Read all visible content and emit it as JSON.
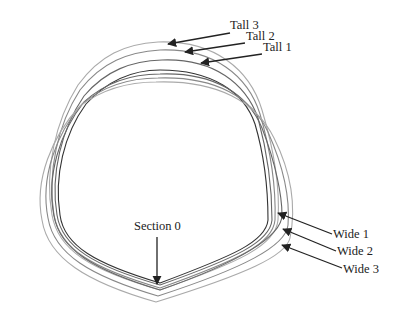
{
  "diagram": {
    "title": "",
    "labels": {
      "tall3": "Tall 3",
      "tall2": "Tall 2",
      "tall1": "Tall 1",
      "wide1": "Wide 1",
      "wide2": "Wide 2",
      "wide3": "Wide 3",
      "section0": "Section 0"
    },
    "curves": [
      {
        "id": "section0",
        "name": "Section 0",
        "color": "#333333"
      },
      {
        "id": "tall1",
        "name": "Tall 1",
        "color": "#555555"
      },
      {
        "id": "tall2",
        "name": "Tall 2",
        "color": "#777777"
      },
      {
        "id": "tall3",
        "name": "Tall 3",
        "color": "#999999"
      },
      {
        "id": "wide1",
        "name": "Wide 1",
        "color": "#666666"
      },
      {
        "id": "wide2",
        "name": "Wide 2",
        "color": "#888888"
      },
      {
        "id": "wide3",
        "name": "Wide 3",
        "color": "#aaaaaa"
      }
    ],
    "colors": {
      "text": "#222222",
      "arrow": "#222222",
      "background": "#ffffff"
    }
  }
}
